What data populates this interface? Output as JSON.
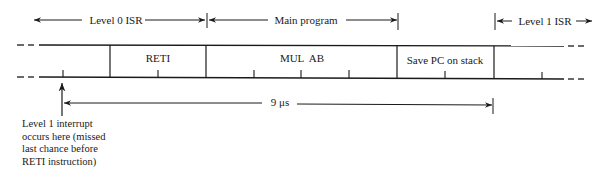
{
  "diagram": {
    "type": "timing-diagram",
    "phases": [
      {
        "label": "Level 0 ISR",
        "x_start": 33,
        "x_end": 206
      },
      {
        "label": "Main program",
        "x_start": 206,
        "x_end": 397
      },
      {
        "label": "Level 1 ISR",
        "x_start": 494,
        "x_end": 590
      }
    ],
    "instructions": [
      {
        "label": "RETI",
        "x_start": 110,
        "x_end": 206
      },
      {
        "label": "MUL  AB",
        "x_start": 206,
        "x_end": 397
      },
      {
        "label": "Save PC on stack",
        "x_start": 397,
        "x_end": 494
      }
    ],
    "ticks_x": [
      63,
      158,
      254,
      301,
      349,
      445,
      542
    ],
    "interval": {
      "label": "9 μs",
      "x_start": 63,
      "x_end": 493
    },
    "annotation": {
      "lines": [
        "Level 1 interrupt",
        "occurs here (missed",
        "last chance before",
        "RETI instruction)"
      ]
    }
  }
}
